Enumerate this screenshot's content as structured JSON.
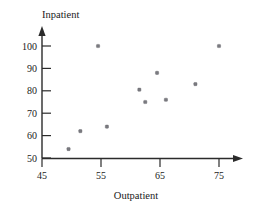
{
  "chart_data": {
    "type": "scatter",
    "title": "",
    "xlabel": "Outpatient",
    "ylabel": "Inpatient",
    "xlim": [
      45,
      78
    ],
    "ylim": [
      50,
      104
    ],
    "xticks": [
      45,
      55,
      65,
      75
    ],
    "yticks": [
      50,
      60,
      70,
      80,
      90,
      100
    ],
    "grid": false,
    "legend": null,
    "marker": "square-dot",
    "marker_color": "#7a7a80",
    "axis_color": "#2b2b2b",
    "series": [
      {
        "name": "Hospitals",
        "points": [
          {
            "x": 49.5,
            "y": 54
          },
          {
            "x": 51.5,
            "y": 62
          },
          {
            "x": 54.5,
            "y": 100
          },
          {
            "x": 56,
            "y": 64
          },
          {
            "x": 61.5,
            "y": 80.5
          },
          {
            "x": 62.5,
            "y": 75
          },
          {
            "x": 64.5,
            "y": 88
          },
          {
            "x": 66,
            "y": 76
          },
          {
            "x": 71,
            "y": 83
          },
          {
            "x": 75,
            "y": 100
          }
        ]
      }
    ],
    "xtick_labels": [
      "45",
      "55",
      "65",
      "75"
    ],
    "ytick_labels": [
      "50",
      "60",
      "70",
      "80",
      "90",
      "100"
    ]
  },
  "labels": {
    "y_axis_title": "Inpatient",
    "x_axis_title": "Outpatient"
  },
  "icons": {
    "x_arrow": "arrow-right-icon",
    "y_arrow": "arrow-up-icon"
  }
}
